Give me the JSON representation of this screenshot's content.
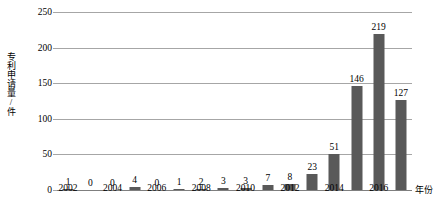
{
  "chart_data": {
    "type": "bar",
    "title": "",
    "xlabel": "年份",
    "ylabel": "专利申请量/件",
    "categories": [
      "2002",
      "2003",
      "2004",
      "2005",
      "2006",
      "2007",
      "2008",
      "2009",
      "2010",
      "2011",
      "2012",
      "2013",
      "2014",
      "2015",
      "2016",
      "2017"
    ],
    "values": [
      1,
      0,
      0,
      4,
      0,
      1,
      2,
      3,
      3,
      7,
      8,
      23,
      51,
      146,
      219,
      127
    ],
    "data_labels": [
      "1",
      "0",
      "0",
      "4",
      "0",
      "1",
      "2",
      "3",
      "3",
      "7",
      "8",
      "23",
      "51",
      "146",
      "219",
      "127"
    ],
    "x_tick_labels": [
      "2002",
      "2004",
      "2006",
      "2008",
      "2010",
      "2012",
      "2014",
      "2016"
    ],
    "y_ticks": [
      0,
      50,
      100,
      150,
      200,
      250
    ],
    "y_tick_labels": [
      "0",
      "50",
      "100",
      "150",
      "200",
      "250"
    ],
    "ylim": [
      0,
      250
    ],
    "grid": true,
    "legend": false,
    "bar_color": "#595959",
    "gridline_color": "#a6a6a6",
    "axis_color": "#7f7f7f",
    "background": "#ffffff"
  }
}
